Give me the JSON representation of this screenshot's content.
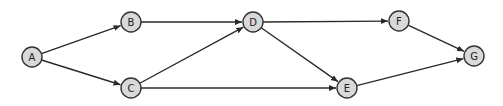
{
  "diagram": {
    "type": "directed-graph",
    "node_radius": 10,
    "colors": {
      "node_fill": "#d9d9d9",
      "node_stroke": "#333333",
      "edge": "#2a2a2a",
      "background": "#ffffff"
    },
    "nodes": [
      {
        "id": "A",
        "label": "A",
        "x": 32,
        "y": 57
      },
      {
        "id": "B",
        "label": "B",
        "x": 131,
        "y": 22
      },
      {
        "id": "C",
        "label": "C",
        "x": 131,
        "y": 88
      },
      {
        "id": "D",
        "label": "D",
        "x": 253,
        "y": 22
      },
      {
        "id": "E",
        "label": "E",
        "x": 347,
        "y": 88
      },
      {
        "id": "F",
        "label": "F",
        "x": 399,
        "y": 21
      },
      {
        "id": "G",
        "label": "G",
        "x": 474,
        "y": 56
      }
    ],
    "edges": [
      {
        "from": "A",
        "to": "B"
      },
      {
        "from": "A",
        "to": "C"
      },
      {
        "from": "B",
        "to": "D"
      },
      {
        "from": "C",
        "to": "D"
      },
      {
        "from": "C",
        "to": "E"
      },
      {
        "from": "D",
        "to": "F"
      },
      {
        "from": "D",
        "to": "E"
      },
      {
        "from": "F",
        "to": "G"
      },
      {
        "from": "E",
        "to": "G"
      }
    ]
  }
}
